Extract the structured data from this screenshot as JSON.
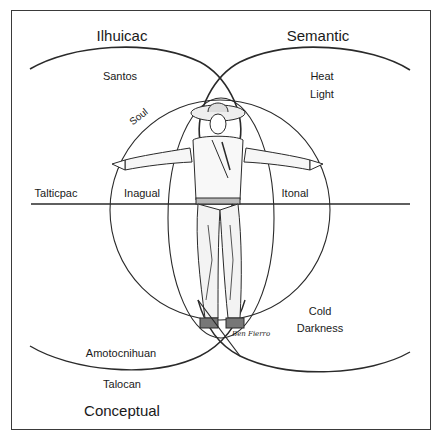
{
  "diagram": {
    "quadrant_titles": {
      "top_left": "Ilhuicac",
      "top_right": "Semantic",
      "bottom_left": "Conceptual"
    },
    "top_left_labels": [
      "Santos"
    ],
    "top_right_labels": [
      "Heat",
      "Light"
    ],
    "inner_circle_label": "Soul",
    "horizontal_axis_labels": {
      "left_outer": "Talticpac",
      "left_inner": "Inagual",
      "right_inner": "Itonal"
    },
    "bottom_right_labels": [
      "Cold",
      "Darkness"
    ],
    "bottom_left_labels": {
      "inner": "Amotocnihuan",
      "outer": "Talocan"
    },
    "figure": {
      "description": "Hand-drawn man in sombrero with arms outstretched",
      "signature": "Ben Fierro"
    },
    "colors": {
      "line": "#2a2a2a",
      "text": "#1a1a1a",
      "background": "#ffffff"
    }
  }
}
